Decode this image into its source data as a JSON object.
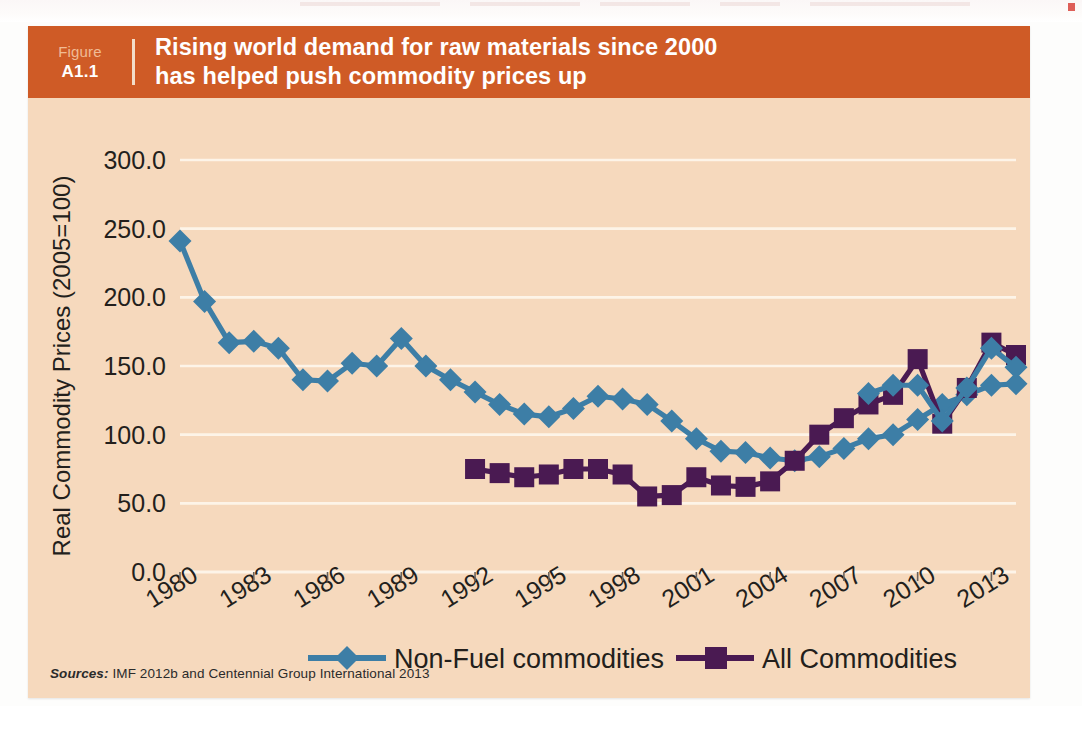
{
  "figure": {
    "label_word": "Figure",
    "number": "A1.1",
    "title_line1": "Rising world demand for raw materials since 2000",
    "title_line2": "has helped push commodity prices up",
    "band_color": "#cf5b26",
    "card_color": "#f6d9bd"
  },
  "source": {
    "label": "Sources:",
    "text": "IMF 2012b and Centennial Group International 2013"
  },
  "legend": {
    "items": [
      {
        "label": "Non-Fuel commodities",
        "color": "#3d7ea6",
        "marker": "diamond"
      },
      {
        "label": "All Commodities",
        "color": "#4a1a52",
        "marker": "square"
      }
    ]
  },
  "chart_data": {
    "type": "line",
    "title": "Rising world demand for raw materials since 2000 has helped push commodity prices up",
    "xlabel": "",
    "ylabel": "Real Commodity Prices (2005=100)",
    "ylim": [
      0,
      300
    ],
    "yticks": [
      0,
      50,
      100,
      150,
      200,
      250,
      300
    ],
    "ytick_labels": [
      "0.0",
      "50.0",
      "100.0",
      "150.0",
      "200.0",
      "250.0",
      "300.0"
    ],
    "xlim": [
      1980,
      2014
    ],
    "xticks": [
      1980,
      1983,
      1986,
      1989,
      1992,
      1995,
      1998,
      2001,
      2004,
      2007,
      2010,
      2013
    ],
    "xtick_labels": [
      "1980",
      "1983",
      "1986",
      "1989",
      "1992",
      "1995",
      "1998",
      "2001",
      "2004",
      "2007",
      "2010",
      "2013"
    ],
    "grid": "horizontal",
    "legend_position": "bottom",
    "x": [
      1980,
      1981,
      1982,
      1983,
      1984,
      1985,
      1986,
      1987,
      1988,
      1989,
      1990,
      1991,
      1992,
      1993,
      1994,
      1995,
      1996,
      1997,
      1998,
      1999,
      2000,
      2001,
      2002,
      2003,
      2004,
      2005,
      2006,
      2007,
      2008,
      2009,
      2010,
      2011,
      2012,
      2013,
      2014
    ],
    "series": [
      {
        "name": "Non-Fuel commodities",
        "color": "#3d7ea6",
        "marker": "diamond",
        "x": [
          1980,
          1981,
          1982,
          1983,
          1984,
          1985,
          1986,
          1987,
          1988,
          1989,
          1990,
          1991,
          1992,
          1993,
          1994,
          1995,
          1996,
          1997,
          1998,
          1999,
          2000,
          2001,
          2002,
          2003,
          2004,
          2005,
          2006,
          2007,
          2008,
          2009,
          2010,
          2011,
          2012,
          2013,
          2014
        ],
        "values": [
          241,
          197,
          167,
          168,
          163,
          140,
          139,
          152,
          150,
          170,
          150,
          140,
          131,
          122,
          115,
          113,
          119,
          128,
          126,
          122,
          110,
          97,
          88,
          87,
          83,
          81,
          84,
          90,
          97,
          100,
          111,
          122,
          129,
          136,
          137
        ]
      },
      {
        "name": "All Commodities",
        "color": "#4a1a52",
        "marker": "square",
        "x": [
          1992,
          1993,
          1994,
          1995,
          1996,
          1997,
          1998,
          1999,
          2000,
          2001,
          2002,
          2003,
          2004,
          2005,
          2006,
          2007,
          2008,
          2009,
          2010,
          2011,
          2012,
          2013,
          2014
        ],
        "values": [
          75,
          72,
          69,
          71,
          75,
          75,
          71,
          55,
          56,
          69,
          63,
          62,
          66,
          81,
          100,
          112,
          122,
          129,
          155,
          108,
          134,
          167,
          158
        ]
      },
      {
        "name": "Non-Fuel commodities (late)",
        "color": "#3d7ea6",
        "marker": "diamond",
        "x": [
          2008,
          2009,
          2010,
          2011,
          2012,
          2013,
          2014
        ],
        "values": [
          130,
          136,
          136,
          110,
          134,
          163,
          149
        ]
      }
    ]
  },
  "axis": {
    "y_title": "Real Commodity Prices (2005=100)"
  }
}
